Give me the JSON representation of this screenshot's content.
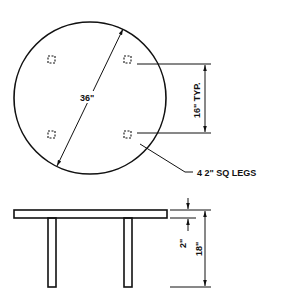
{
  "drawing": {
    "title": "Round table drawing",
    "top_view": {
      "diameter_label": "36\"",
      "leg_spacing_label": "16\" TYP.",
      "leg_callout": "4 2\" SQ LEGS"
    },
    "side_view": {
      "top_thickness_label": "2\"",
      "height_label": "18\""
    },
    "colors": {
      "line": "#111111",
      "background": "#ffffff"
    }
  }
}
